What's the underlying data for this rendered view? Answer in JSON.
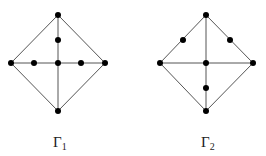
{
  "graphs": [
    {
      "label": "Γ",
      "subscript": "1",
      "label_pos": [
        58,
        147
      ],
      "vertices": [
        {
          "id": "top",
          "x": 58,
          "y": 15
        },
        {
          "id": "left",
          "x": 11,
          "y": 63
        },
        {
          "id": "center",
          "x": 58,
          "y": 63
        },
        {
          "id": "right",
          "x": 105,
          "y": 63
        },
        {
          "id": "bottom",
          "x": 58,
          "y": 111
        },
        {
          "id": "upper-mid",
          "x": 58,
          "y": 40
        },
        {
          "id": "left-mid",
          "x": 34,
          "y": 63
        },
        {
          "id": "right-mid",
          "x": 81,
          "y": 63
        }
      ],
      "edges": [
        [
          58,
          15,
          11,
          63
        ],
        [
          58,
          15,
          105,
          63
        ],
        [
          11,
          63,
          58,
          111
        ],
        [
          105,
          63,
          58,
          111
        ],
        [
          11,
          63,
          105,
          63
        ],
        [
          58,
          15,
          58,
          111
        ]
      ]
    },
    {
      "label": "Γ",
      "subscript": "2",
      "label_pos": [
        206,
        147
      ],
      "vertices": [
        {
          "id": "top",
          "x": 206,
          "y": 15
        },
        {
          "id": "left",
          "x": 160,
          "y": 63
        },
        {
          "id": "center",
          "x": 206,
          "y": 63
        },
        {
          "id": "right",
          "x": 253,
          "y": 63
        },
        {
          "id": "bottom",
          "x": 206,
          "y": 111
        },
        {
          "id": "upper-left-mid",
          "x": 183,
          "y": 40
        },
        {
          "id": "upper-right-mid",
          "x": 230,
          "y": 40
        },
        {
          "id": "lower-mid",
          "x": 206,
          "y": 88
        }
      ],
      "edges": [
        [
          206,
          15,
          160,
          63
        ],
        [
          206,
          15,
          253,
          63
        ],
        [
          160,
          63,
          206,
          111
        ],
        [
          253,
          63,
          206,
          111
        ],
        [
          160,
          63,
          253,
          63
        ],
        [
          206,
          15,
          206,
          111
        ]
      ]
    }
  ]
}
